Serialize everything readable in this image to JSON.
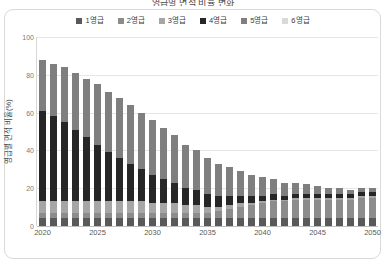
{
  "chart_title": "영급별 면적 비율 변화",
  "legend": {
    "position": "top-center",
    "items": [
      {
        "label": "1영급",
        "color": "#595959"
      },
      {
        "label": "2영급",
        "color": "#8c8c8c"
      },
      {
        "label": "3영급",
        "color": "#a6a6a6"
      },
      {
        "label": "4영급",
        "color": "#262626"
      },
      {
        "label": "5영급",
        "color": "#7f7f7f"
      },
      {
        "label": "6영급",
        "color": "#d9d9d9"
      }
    ]
  },
  "axes": {
    "ylabel": "영급별 면적 비율(%)",
    "yticks": [
      0,
      20,
      40,
      60,
      80,
      100
    ],
    "ylim": [
      0,
      100
    ],
    "xlabel": "",
    "xticks": [
      "2020",
      "2025",
      "2030",
      "2035",
      "2040",
      "2045",
      "2050"
    ],
    "xtick_positions": [
      0,
      5,
      10,
      15,
      20,
      25,
      30
    ],
    "grid": true
  },
  "chart_data": {
    "type": "bar",
    "stacked": true,
    "title": "영급별 면적 비율 변화",
    "xlabel": "",
    "ylabel": "영급별 면적 비율(%)",
    "ylim": [
      0,
      100
    ],
    "categories": [
      "2020",
      "2021",
      "2022",
      "2023",
      "2024",
      "2025",
      "2026",
      "2027",
      "2028",
      "2029",
      "2030",
      "2031",
      "2032",
      "2033",
      "2034",
      "2035",
      "2036",
      "2037",
      "2038",
      "2039",
      "2040",
      "2041",
      "2042",
      "2043",
      "2044",
      "2045",
      "2046",
      "2047",
      "2048",
      "2049",
      "2050"
    ],
    "series": [
      {
        "name": "1영급",
        "color": "#595959",
        "values": [
          4,
          4,
          4,
          4,
          4,
          4,
          4,
          4,
          4,
          4,
          4,
          4,
          4,
          4,
          4,
          4,
          4,
          4,
          4,
          4,
          4,
          4,
          4,
          4,
          4,
          4,
          4,
          4,
          4,
          4,
          4
        ]
      },
      {
        "name": "2영급",
        "color": "#8c8c8c",
        "values": [
          3,
          3,
          3,
          3,
          3,
          3,
          3,
          3,
          3,
          3,
          3,
          3,
          3,
          3,
          3,
          3,
          4,
          5,
          6,
          7,
          8,
          9,
          9,
          10,
          10,
          10,
          10,
          10,
          10,
          11,
          11
        ]
      },
      {
        "name": "3영급",
        "color": "#a6a6a6",
        "values": [
          6,
          6,
          6,
          6,
          6,
          6,
          6,
          6,
          6,
          6,
          5,
          5,
          5,
          4,
          4,
          3,
          2,
          2,
          2,
          1,
          1,
          1,
          1,
          1,
          1,
          1,
          1,
          1,
          1,
          1,
          1
        ]
      },
      {
        "name": "4영급",
        "color": "#262626",
        "values": [
          48,
          45,
          42,
          38,
          34,
          30,
          26,
          23,
          20,
          17,
          15,
          13,
          11,
          9,
          8,
          7,
          6,
          5,
          4,
          4,
          3,
          3,
          2,
          2,
          2,
          2,
          2,
          2,
          2,
          2,
          2
        ]
      },
      {
        "name": "5영급",
        "color": "#7f7f7f",
        "values": [
          27,
          28,
          29,
          30,
          31,
          32,
          32,
          32,
          31,
          30,
          29,
          27,
          25,
          23,
          21,
          19,
          17,
          15,
          13,
          11,
          10,
          8,
          7,
          6,
          5,
          4,
          3,
          3,
          2,
          2,
          2
        ]
      },
      {
        "name": "6영급",
        "color": "#d9d9d9",
        "values": [
          0,
          0,
          0,
          0,
          0,
          0,
          0,
          0,
          0,
          0,
          0,
          0,
          0,
          0,
          0,
          0,
          0,
          0,
          0,
          0,
          0,
          0,
          0,
          0,
          0,
          0,
          0,
          0,
          0,
          0,
          0
        ]
      }
    ],
    "totals": [
      88,
      86,
      84,
      81,
      78,
      75,
      71,
      68,
      64,
      60,
      56,
      52,
      48,
      43,
      40,
      36,
      33,
      31,
      29,
      27,
      26,
      25,
      23,
      23,
      22,
      21,
      20,
      20,
      19,
      20,
      20
    ]
  }
}
